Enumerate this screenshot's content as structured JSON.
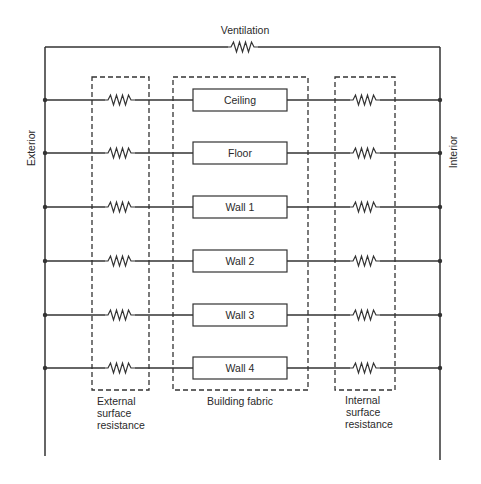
{
  "diagram": {
    "type": "thermal-resistance-network",
    "ventilation_label": "Ventilation",
    "exterior_label": "Exterior",
    "interior_label": "Interior",
    "groups": {
      "external": {
        "label_lines": [
          "External",
          "surface",
          "resistance"
        ]
      },
      "fabric": {
        "label_lines": [
          "Building fabric"
        ]
      },
      "internal": {
        "label_lines": [
          "Internal",
          "surface",
          "resistance"
        ]
      }
    },
    "elements": [
      {
        "label": "Ceiling"
      },
      {
        "label": "Floor"
      },
      {
        "label": "Wall 1"
      },
      {
        "label": "Wall 2"
      },
      {
        "label": "Wall 3"
      },
      {
        "label": "Wall 4"
      }
    ],
    "colors": {
      "line": "#333333",
      "background": "#ffffff"
    }
  }
}
